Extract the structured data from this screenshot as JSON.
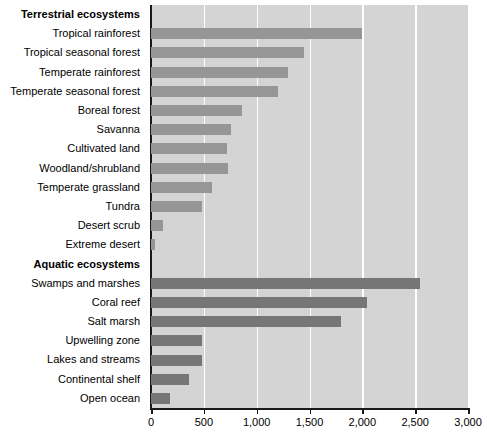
{
  "chart_data": {
    "type": "bar",
    "orientation": "horizontal",
    "title": "",
    "xlabel": "",
    "ylabel": "",
    "xlim": [
      0,
      3000
    ],
    "xticks": [
      0,
      500,
      1000,
      1500,
      2000,
      2500,
      3000
    ],
    "xticklabels": [
      "0",
      "500",
      "1,000",
      "1,500",
      "2,000",
      "2,500",
      "3,000"
    ],
    "grid": "vertical-white",
    "legend": "none",
    "colors": {
      "terrestrial_bar": "#969696",
      "aquatic_bar": "#767676",
      "plot_background": "#d4d4d4",
      "gridline": "#ffffff",
      "axis": "#1a1a1a",
      "page_background": "#ffffff"
    },
    "sections": [
      {
        "header": "Terrestrial ecosystems",
        "series_name": "terrestrial",
        "categories": [
          "Tropical rainforest",
          "Tropical seasonal forest",
          "Temperate rainforest",
          "Temperate seasonal forest",
          "Boreal forest",
          "Savanna",
          "Cultivated land",
          "Woodland/shrubland",
          "Temperate grassland",
          "Tundra",
          "Desert scrub",
          "Extreme desert"
        ],
        "values": [
          2000,
          1450,
          1300,
          1200,
          860,
          760,
          720,
          730,
          580,
          480,
          115,
          40
        ]
      },
      {
        "header": "Aquatic ecosystems",
        "series_name": "aquatic",
        "categories": [
          "Swamps and marshes",
          "Coral reef",
          "Salt marsh",
          "Upwelling zone",
          "Lakes and streams",
          "Continental shelf",
          "Open ocean"
        ],
        "values": [
          2550,
          2040,
          1800,
          480,
          480,
          360,
          180
        ]
      }
    ]
  }
}
